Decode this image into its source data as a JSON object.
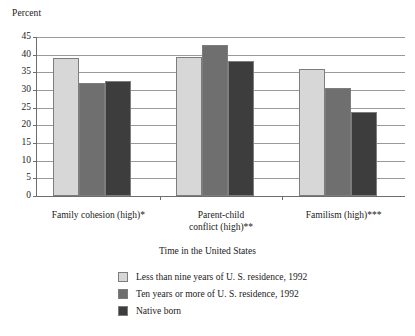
{
  "chart_data": {
    "type": "bar",
    "title": "",
    "ylabel": "Percent",
    "xlabel": "Time in the United States",
    "ylim": [
      0,
      45
    ],
    "yticks": [
      0,
      5,
      10,
      15,
      20,
      25,
      30,
      35,
      40,
      45
    ],
    "ytick_labels": [
      "0",
      "5",
      "10",
      "15",
      "20",
      "25",
      "30",
      "35",
      "40",
      "45"
    ],
    "grid": true,
    "legend_position": "bottom-center",
    "categories": [
      "Family cohesion (high)*",
      "Parent-child\nconflict (high)**",
      "Familism (high)***"
    ],
    "category_lines": [
      [
        "Family cohesion (high)*"
      ],
      [
        "Parent-child",
        "conflict (high)**"
      ],
      [
        "Familism (high)***"
      ]
    ],
    "series": [
      {
        "name": "Less than nine years of U. S. residence, 1992",
        "color": "#d7d7d7",
        "values": [
          39.0,
          39.4,
          36.0
        ]
      },
      {
        "name": "Ten years or more of U. S. residence, 1992",
        "color": "#6f6f6f",
        "values": [
          32.1,
          42.8,
          30.5
        ]
      },
      {
        "name": "Native born",
        "color": "#3d3d3d",
        "values": [
          32.5,
          38.1,
          23.8
        ]
      }
    ]
  },
  "legend": {
    "title": "Time in the United States",
    "items": [
      {
        "label": "Less than nine years of U. S. residence, 1992",
        "color": "#d7d7d7"
      },
      {
        "label": "Ten years or more of U. S. residence, 1992",
        "color": "#6f6f6f"
      },
      {
        "label": "Native born",
        "color": "#3d3d3d"
      }
    ]
  },
  "colors": {
    "axis": "#6d6d6d",
    "gridline": "#9a9a9a",
    "bar_outline": "#7d7d7d",
    "text": "#1a1a1a",
    "background": "#ffffff"
  }
}
